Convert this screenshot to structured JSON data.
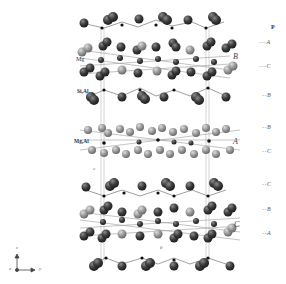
{
  "figure": {
    "site_labels": {
      "mg": "Mg",
      "si_al": "Si,Al",
      "mg_al": "Mg,Al"
    },
    "layer_labels": {
      "top": "B",
      "middle": "A",
      "bottom": "C"
    },
    "cell_axis_labels": {
      "c": "c",
      "b": "b"
    },
    "stacking_column": {
      "header": "P",
      "sequence": [
        "A",
        "C",
        "B",
        "B",
        "C",
        "C",
        "B",
        "A"
      ]
    },
    "axes_triad": {
      "z": "z",
      "x": "x",
      "y": "y"
    },
    "colors": {
      "dark_atom": "#3c3c3c",
      "light_atom": "#9a9a9a",
      "cation": "#111111",
      "bond": "#777777",
      "cell_edge": "#bbbbbb"
    }
  }
}
